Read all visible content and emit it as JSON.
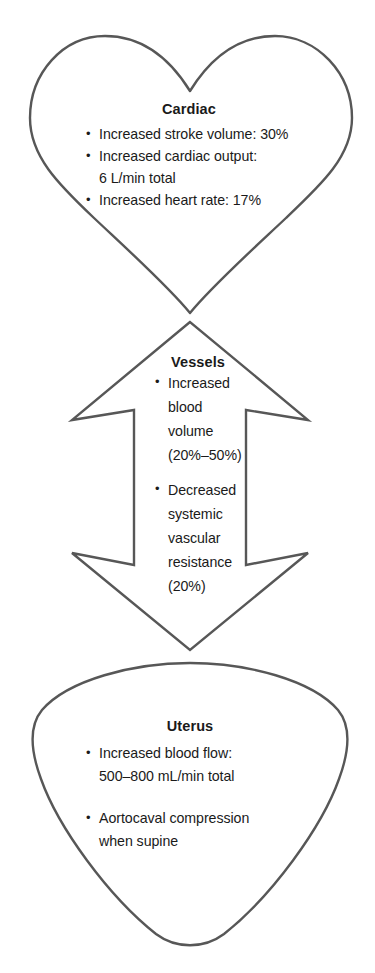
{
  "diagram": {
    "stroke_color": "#575757",
    "text_color": "#1a1a1a",
    "background_color": "#ffffff"
  },
  "sections": {
    "cardiac": {
      "shape": "heart-shape",
      "title": "Cardiac",
      "bullets": [
        {
          "lines": [
            "Increased stroke volume: 30%"
          ]
        },
        {
          "lines": [
            "Increased cardiac output:",
            "6 L/min total"
          ]
        },
        {
          "lines": [
            "Increased heart rate: 17%"
          ]
        }
      ]
    },
    "vessels": {
      "shape": "double-headed-vertical-arrow-shape",
      "title": "Vessels",
      "bullets": [
        {
          "lines": [
            "Increased",
            "blood",
            "volume",
            "(20%–50%)"
          ]
        },
        {
          "lines": [
            "Decreased",
            "systemic",
            "vascular",
            "resistance",
            "(20%)"
          ]
        }
      ]
    },
    "uterus": {
      "shape": "inverted-rounded-triangle-shape",
      "title": "Uterus",
      "bullets": [
        {
          "lines": [
            "Increased blood flow:",
            "500–800 mL/min total"
          ]
        },
        {
          "lines": [
            "Aortocaval compression",
            "when supine"
          ]
        }
      ]
    }
  }
}
